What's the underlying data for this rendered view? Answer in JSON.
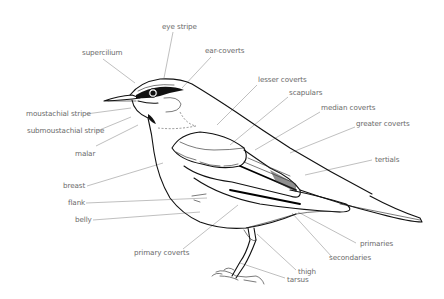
{
  "diagram": {
    "labels": {
      "eye_stripe": "eye stripe",
      "supercilium": "supercilium",
      "ear_coverts": "ear-coverts",
      "lesser_coverts": "lesser coverts",
      "scapulars": "scapulars",
      "median_coverts": "median coverts",
      "greater_coverts": "greater coverts",
      "tertials": "tertials",
      "moustachial_stripe": "moustachial stripe",
      "submoustachial_stripe": "submoustachial stripe",
      "malar": "malar",
      "breast": "breast",
      "flank": "flank",
      "belly": "belly",
      "primary_coverts": "primary coverts",
      "primaries": "primaries",
      "secondaries": "secondaries",
      "thigh": "thigh",
      "tarsus": "tarsus"
    },
    "colors": {
      "label_text": "#6a6a6a",
      "leader_line": "#8a8a8a",
      "ink": "#111111",
      "background": "#ffffff"
    }
  }
}
